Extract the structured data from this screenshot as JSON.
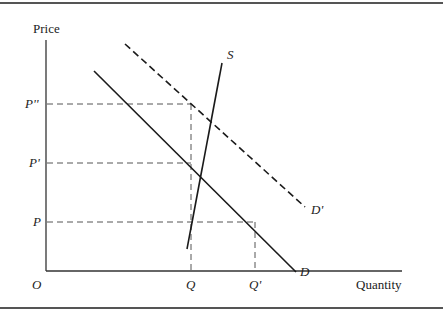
{
  "diagram": {
    "type": "supply-demand",
    "axes": {
      "y_label": "Price",
      "x_label": "Quantity",
      "origin_label": "O"
    },
    "price_levels": [
      {
        "label": "P''",
        "y": 104
      },
      {
        "label": "P'",
        "y": 163
      },
      {
        "label": "P",
        "y": 222
      }
    ],
    "quantity_levels": [
      {
        "label": "Q",
        "x": 191
      },
      {
        "label": "Q'",
        "x": 255
      }
    ],
    "curves": [
      {
        "id": "supply",
        "label": "S",
        "style": "solid"
      },
      {
        "id": "demand",
        "label": "D",
        "style": "solid"
      },
      {
        "id": "demand-shifted",
        "label": "D'",
        "style": "dashed"
      }
    ],
    "colors": {
      "line": "#1a1a1a",
      "guide": "#555555",
      "border": "#555555",
      "background": "#ffffff"
    }
  }
}
